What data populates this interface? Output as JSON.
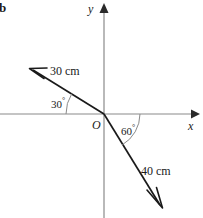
{
  "figure": {
    "part_label": "b",
    "background_color": "#ffffff",
    "stroke_color": "#1a1a1a",
    "axis_color": "#7a7a7a",
    "width": 203,
    "height": 218
  },
  "axes": {
    "x_label": "x",
    "y_label": "y",
    "origin_label": "O",
    "origin": {
      "x": 104,
      "y": 114
    }
  },
  "vectors": [
    {
      "id": "vector-30cm",
      "magnitude_label": "30 cm",
      "magnitude": 30,
      "unit": "cm",
      "angle_label": "30",
      "angle_degrees": 30,
      "angle_reference": "above negative x-axis",
      "direction": "up-left",
      "tip": {
        "x": 31,
        "y": 68
      }
    },
    {
      "id": "vector-40cm",
      "magnitude_label": "40 cm",
      "magnitude": 40,
      "unit": "cm",
      "angle_label": "60",
      "angle_degrees": 60,
      "angle_reference": "below positive x-axis",
      "direction": "down-right",
      "tip": {
        "x": 162,
        "y": 207
      }
    }
  ],
  "angles": [
    {
      "id": "angle-30",
      "label": "30",
      "degree_symbol": "°"
    },
    {
      "id": "angle-60",
      "label": "60",
      "degree_symbol": "°"
    }
  ]
}
